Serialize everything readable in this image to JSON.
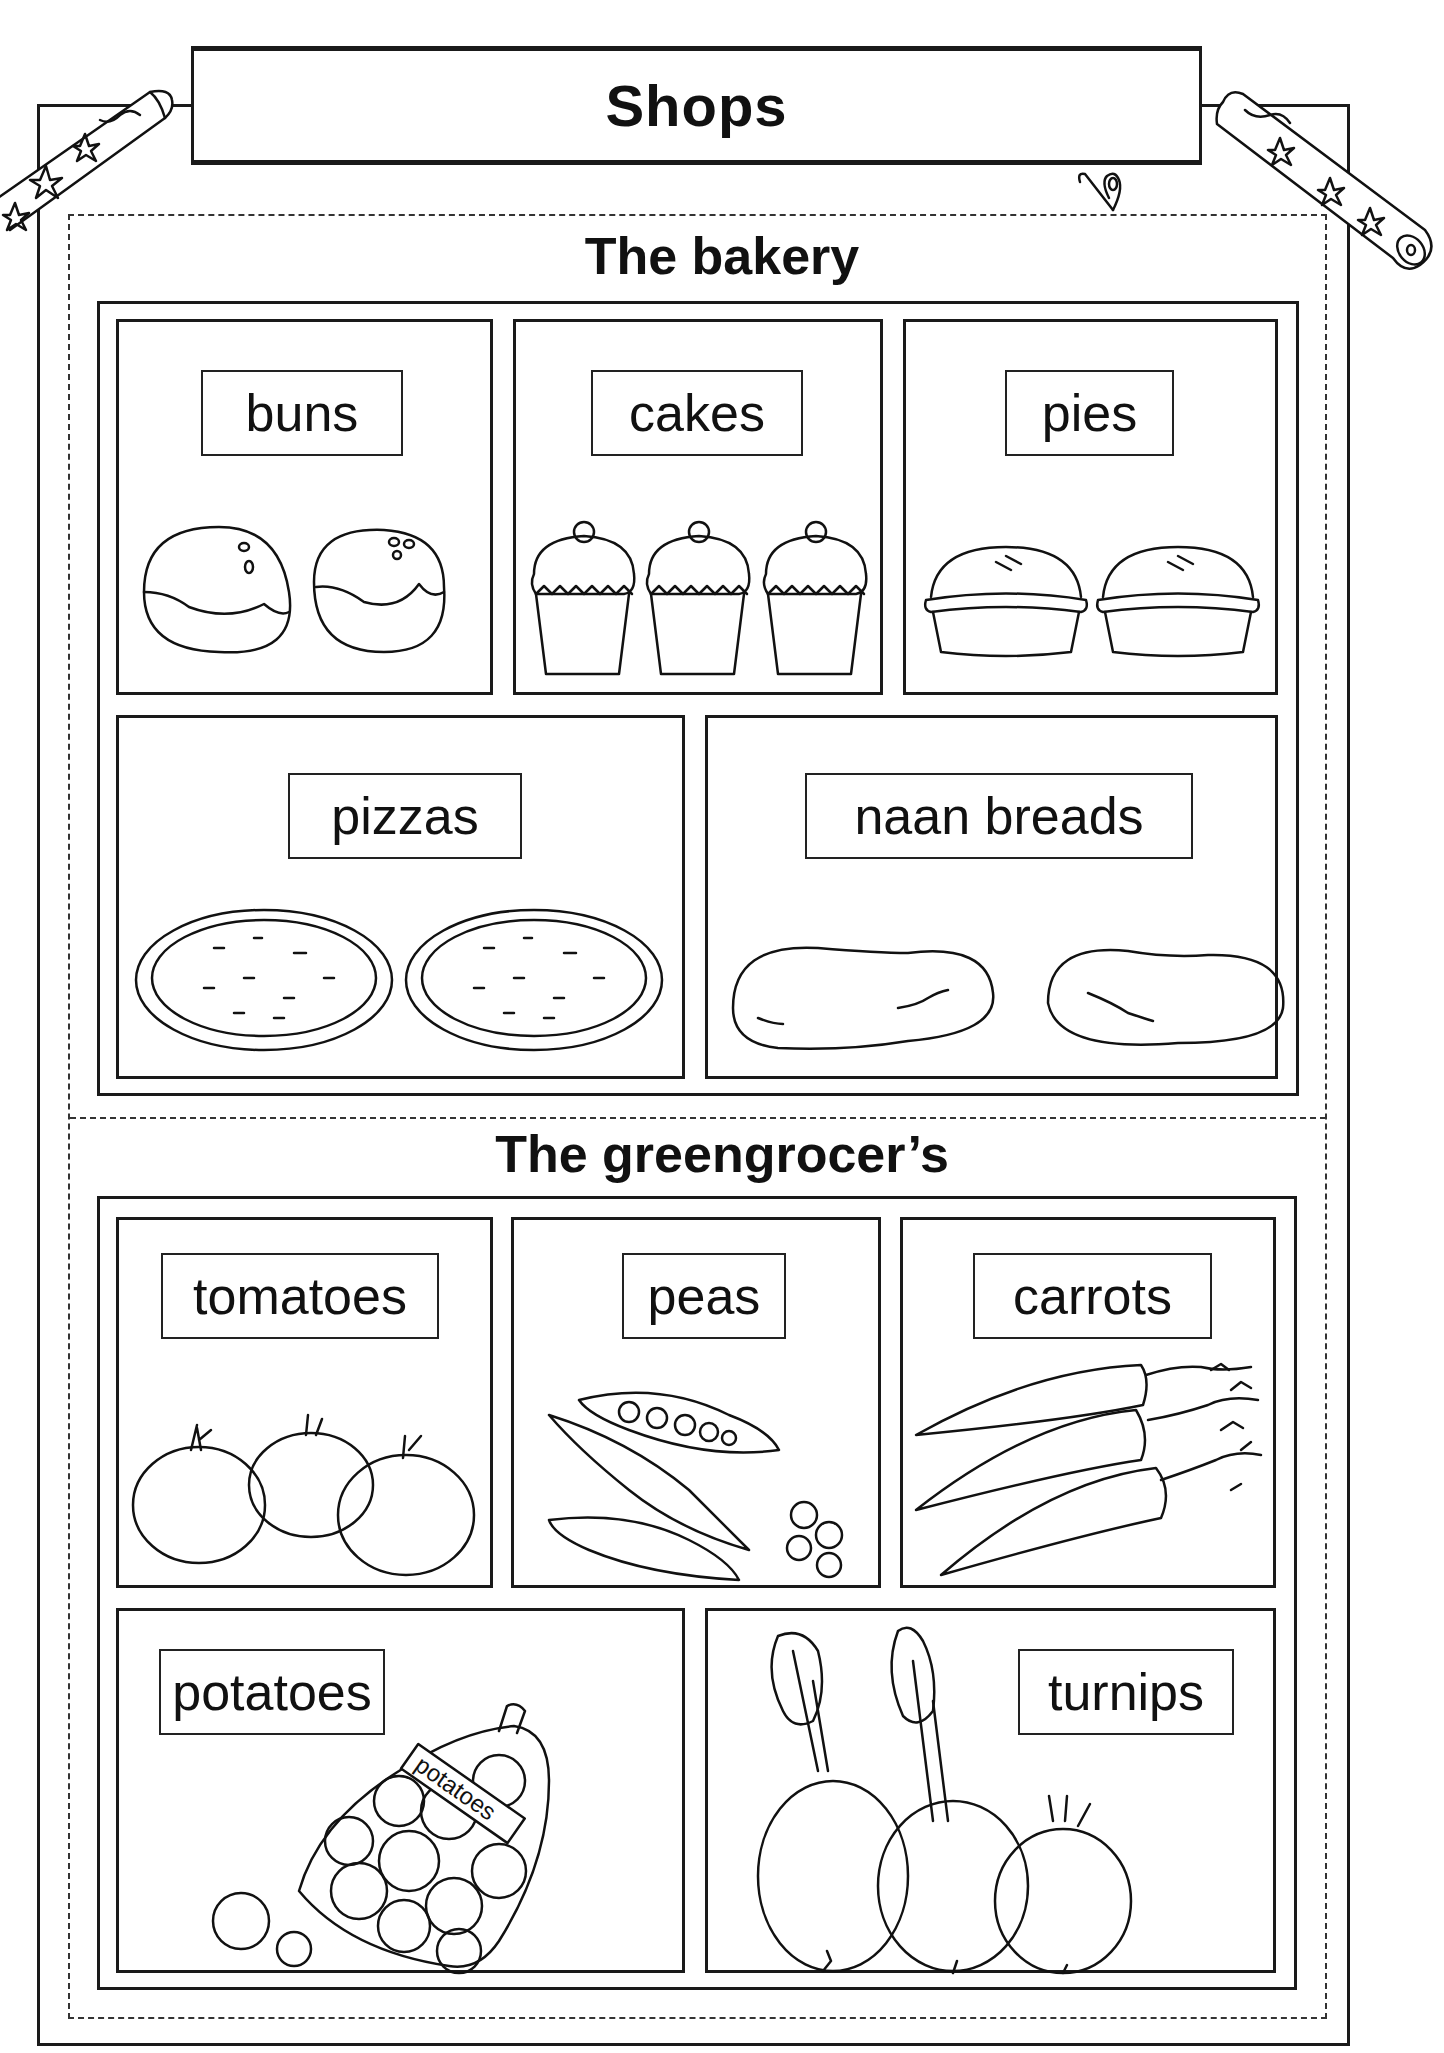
{
  "worksheet": {
    "title": "Shops",
    "sections": [
      {
        "heading": "The bakery",
        "items": [
          {
            "label": "buns",
            "picture": "two iced buns"
          },
          {
            "label": "cakes",
            "picture": "three cupcakes with cherries"
          },
          {
            "label": "pies",
            "picture": "two pies"
          },
          {
            "label": "pizzas",
            "picture": "two pizzas"
          },
          {
            "label": "naan breads",
            "picture": "two naan breads"
          }
        ]
      },
      {
        "heading": "The greengrocer’s",
        "items": [
          {
            "label": "tomatoes",
            "picture": "three tomatoes"
          },
          {
            "label": "peas",
            "picture": "pea pods and loose peas"
          },
          {
            "label": "carrots",
            "picture": "three carrots with leafy tops"
          },
          {
            "label": "potatoes",
            "picture": "net bag of potatoes",
            "bag_tag": "potatoes"
          },
          {
            "label": "turnips",
            "picture": "three turnips with leaves"
          }
        ]
      }
    ],
    "decorations": [
      "pencil-left-icon",
      "pencil-right-icon",
      "paperclip-icon"
    ]
  }
}
